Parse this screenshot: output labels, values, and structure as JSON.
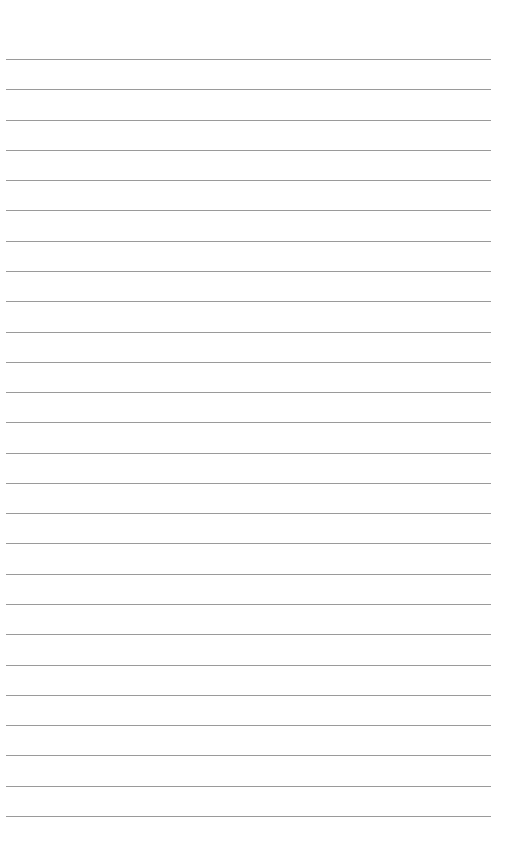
{
  "page": {
    "type": "lined-paper",
    "background_color": "#ffffff",
    "line_color": "#9a9a9a",
    "line_count": 26,
    "first_line_y": 59,
    "line_spacing": 30.28,
    "line_left": 6,
    "line_width": 485,
    "text": ""
  }
}
